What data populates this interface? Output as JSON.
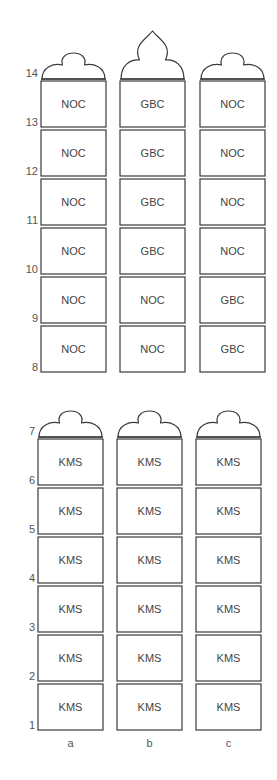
{
  "diagram": {
    "type": "stacked-block-columns",
    "stroke_color": "#3a3a3a",
    "text_color": "#444444",
    "row_height": 49,
    "columns": [
      {
        "id": "a",
        "label": "a"
      },
      {
        "id": "b",
        "label": "b"
      },
      {
        "id": "c",
        "label": "c"
      }
    ],
    "sections": [
      {
        "name": "upper",
        "rows_from": 8,
        "rows_to": 14,
        "top_y": 80,
        "col_x": [
          41,
          120,
          200
        ],
        "col_width": 65,
        "domes": [
          "round",
          "pointed",
          "round"
        ],
        "cells": [
          [
            "NOC",
            "GBC",
            "NOC"
          ],
          [
            "NOC",
            "GBC",
            "NOC"
          ],
          [
            "NOC",
            "GBC",
            "NOC"
          ],
          [
            "NOC",
            "GBC",
            "NOC"
          ],
          [
            "NOC",
            "NOC",
            "GBC"
          ],
          [
            "NOC",
            "NOC",
            "GBC"
          ]
        ],
        "row_labels": [
          "14",
          "13",
          "12",
          "11",
          "10",
          "9",
          "8"
        ]
      },
      {
        "name": "lower",
        "rows_from": 1,
        "rows_to": 7,
        "top_y": 438,
        "col_x": [
          38,
          117,
          196
        ],
        "col_width": 65,
        "domes": [
          "round",
          "round",
          "round"
        ],
        "cells": [
          [
            "KMS",
            "KMS",
            "KMS"
          ],
          [
            "KMS",
            "KMS",
            "KMS"
          ],
          [
            "KMS",
            "KMS",
            "KMS"
          ],
          [
            "KMS",
            "KMS",
            "KMS"
          ],
          [
            "KMS",
            "KMS",
            "KMS"
          ],
          [
            "KMS",
            "KMS",
            "KMS"
          ]
        ],
        "row_labels": [
          "7",
          "6",
          "5",
          "4",
          "3",
          "2",
          "1"
        ]
      }
    ]
  }
}
